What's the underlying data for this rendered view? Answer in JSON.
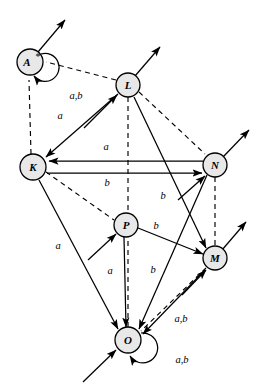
{
  "figure": {
    "type": "state-transition-diagram",
    "background": "#ffffff",
    "node_fill": "#e8e8e8",
    "stroke": "#000000"
  },
  "nodes": [
    {
      "id": "A",
      "label": "A",
      "superscript": "*",
      "x": 30,
      "y": 62,
      "r": 13
    },
    {
      "id": "L",
      "label": "L",
      "superscript": "",
      "x": 128,
      "y": 85,
      "r": 12
    },
    {
      "id": "K",
      "label": "K",
      "superscript": "",
      "x": 33,
      "y": 167,
      "r": 13
    },
    {
      "id": "N",
      "label": "N",
      "superscript": "",
      "x": 215,
      "y": 165,
      "r": 12
    },
    {
      "id": "P",
      "label": "P",
      "superscript": "",
      "x": 126,
      "y": 225,
      "r": 12
    },
    {
      "id": "M",
      "label": "M",
      "superscript": "",
      "x": 215,
      "y": 258,
      "r": 12
    },
    {
      "id": "O",
      "label": "O",
      "superscript": "",
      "x": 128,
      "y": 340,
      "r": 13
    }
  ],
  "self_loops": [
    {
      "node": "A",
      "label": "a,b",
      "label_x": 76,
      "label_y": 97
    },
    {
      "node": "O",
      "label": "a,b",
      "label_x": 181,
      "label_y": 360
    }
  ],
  "edge_labels": [
    {
      "text": "a",
      "x": 60,
      "y": 119,
      "edge": "L-to-K"
    },
    {
      "text": "a",
      "x": 106,
      "y": 150,
      "edge": "N-to-K"
    },
    {
      "text": "b",
      "x": 107,
      "y": 182,
      "edge": "K-to-N"
    },
    {
      "text": "b",
      "x": 163,
      "y": 199,
      "edge": "L-to-M"
    },
    {
      "text": "b",
      "x": 155,
      "y": 228,
      "edge": "P-to-M"
    },
    {
      "text": "a",
      "x": 58,
      "y": 248,
      "edge": "K-to-O"
    },
    {
      "text": "a",
      "x": 110,
      "y": 272,
      "edge": "P-to-O"
    },
    {
      "text": "b",
      "x": 153,
      "y": 271,
      "edge": "N-to-O"
    },
    {
      "text": "a,b",
      "x": 180,
      "y": 320,
      "edge": "M-to-O"
    }
  ],
  "directed_edges": [
    {
      "from": "L",
      "to": "K",
      "label": "a",
      "style": "solid"
    },
    {
      "from": "N",
      "to": "K",
      "label": "a",
      "style": "solid"
    },
    {
      "from": "K",
      "to": "N",
      "label": "b",
      "style": "solid"
    },
    {
      "from": "L",
      "to": "M",
      "label": "b",
      "style": "solid"
    },
    {
      "from": "P",
      "to": "M",
      "label": "b",
      "style": "solid"
    },
    {
      "from": "K",
      "to": "O",
      "label": "a",
      "style": "solid"
    },
    {
      "from": "P",
      "to": "O",
      "label": "a",
      "style": "solid"
    },
    {
      "from": "N",
      "to": "O",
      "label": "b",
      "style": "solid"
    },
    {
      "from": "M",
      "to": "O",
      "label": "a,b",
      "style": "solid"
    }
  ],
  "dashed_edges": [
    {
      "from": "K",
      "to": "A"
    },
    {
      "from": "L",
      "to": "A"
    },
    {
      "from": "L",
      "to": "N"
    },
    {
      "from": "K",
      "to": "P"
    },
    {
      "from": "L",
      "to": "O"
    },
    {
      "from": "N",
      "to": "M"
    },
    {
      "from": "M",
      "to": "O"
    }
  ],
  "external_arrows": [
    {
      "node": "A",
      "direction": "out",
      "angle": "up-right"
    },
    {
      "node": "L",
      "direction": "out",
      "angle": "up-right"
    },
    {
      "node": "L",
      "direction": "in",
      "angle": "from-lower-left"
    },
    {
      "node": "N",
      "direction": "out",
      "angle": "up-right"
    },
    {
      "node": "N",
      "direction": "in",
      "angle": "from-lower-left"
    },
    {
      "node": "M",
      "direction": "out",
      "angle": "up-right"
    },
    {
      "node": "M",
      "direction": "in",
      "angle": "from-lower-left"
    },
    {
      "node": "P",
      "direction": "in",
      "angle": "from-lower-left"
    },
    {
      "node": "O",
      "direction": "in",
      "angle": "from-lower-left"
    }
  ]
}
